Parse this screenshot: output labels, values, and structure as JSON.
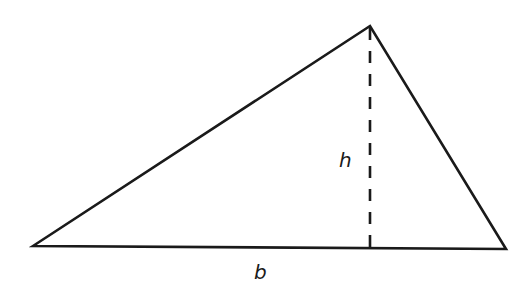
{
  "figure": {
    "type": "triangle-area-diagram",
    "stroke_color": "#1a1a1a",
    "background": "#ffffff",
    "vertices": {
      "left": [
        33,
        246
      ],
      "apex": [
        370,
        26
      ],
      "right": [
        506,
        249
      ]
    },
    "height_line": {
      "x": 370,
      "y_top": 26,
      "y_bottom": 248,
      "style": "dashed"
    },
    "labels": {
      "height": "h",
      "base": "b"
    }
  }
}
